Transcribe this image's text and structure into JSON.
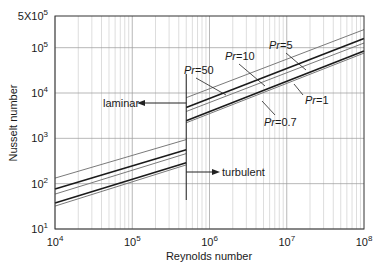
{
  "chart_data": {
    "type": "line",
    "title": "",
    "xlabel": "Reynolds number",
    "ylabel": "Nusselt number",
    "xscale": "log",
    "yscale": "log",
    "xlim": [
      10000,
      100000000
    ],
    "ylim": [
      10,
      500000
    ],
    "grid": true,
    "x_ticks": [
      {
        "value": 10000,
        "base": "10",
        "exp": "4"
      },
      {
        "value": 100000,
        "base": "10",
        "exp": "5"
      },
      {
        "value": 1000000,
        "base": "10",
        "exp": "6"
      },
      {
        "value": 10000000,
        "base": "10",
        "exp": "7"
      },
      {
        "value": 100000000,
        "base": "10",
        "exp": "8"
      }
    ],
    "y_ticks": [
      {
        "value": 10,
        "base": "10",
        "exp": "1"
      },
      {
        "value": 100,
        "base": "10",
        "exp": "2"
      },
      {
        "value": 1000,
        "base": "10",
        "exp": "3"
      },
      {
        "value": 10000,
        "base": "10",
        "exp": "4"
      },
      {
        "value": 100000,
        "base": "10",
        "exp": "5"
      },
      {
        "value": 500000,
        "base": "5X10",
        "exp": "5"
      }
    ],
    "transition_re": 500000,
    "annotations": [
      {
        "text": "laminar",
        "direction": "left"
      },
      {
        "text": "turbulent",
        "direction": "right"
      }
    ],
    "series": [
      {
        "name": "Pr=50",
        "prefix": "Pr",
        "value": "=50",
        "weight": "thin",
        "laminar": {
          "x": [
            10000,
            500000
          ],
          "y": [
            133,
            940
          ]
        },
        "turbulent": {
          "x": [
            500000,
            100000000
          ],
          "y": [
            7900,
            250000
          ]
        }
      },
      {
        "name": "Pr=10",
        "prefix": "Pr",
        "value": "=10",
        "weight": "thick",
        "laminar": {
          "x": [
            10000,
            500000
          ],
          "y": [
            76,
            560
          ]
        },
        "turbulent": {
          "x": [
            500000,
            100000000
          ],
          "y": [
            4800,
            160000
          ]
        }
      },
      {
        "name": "Pr=5",
        "prefix": "Pr",
        "value": "=5",
        "weight": "thin",
        "laminar": {
          "x": [
            10000,
            500000
          ],
          "y": [
            59,
            460
          ]
        },
        "turbulent": {
          "x": [
            500000,
            100000000
          ],
          "y": [
            3900,
            127000
          ]
        }
      },
      {
        "name": "Pr=1",
        "prefix": "Pr",
        "value": "=1",
        "weight": "thick",
        "laminar": {
          "x": [
            10000,
            500000
          ],
          "y": [
            37.5,
            290
          ]
        },
        "turbulent": {
          "x": [
            500000,
            100000000
          ],
          "y": [
            2450,
            85000
          ]
        }
      },
      {
        "name": "Pr=0.7",
        "prefix": "Pr",
        "value": "=0.7",
        "weight": "thin",
        "laminar": {
          "x": [
            10000,
            500000
          ],
          "y": [
            32,
            260
          ]
        },
        "turbulent": {
          "x": [
            500000,
            100000000
          ],
          "y": [
            2200,
            76000
          ]
        }
      }
    ]
  },
  "colors": {
    "thick_line": "#1a1a1a",
    "thin_line": "#7a7a7a",
    "grid_major": "#9a9a9a",
    "grid_minor": "#cfcfcf",
    "axis": "#333333"
  }
}
